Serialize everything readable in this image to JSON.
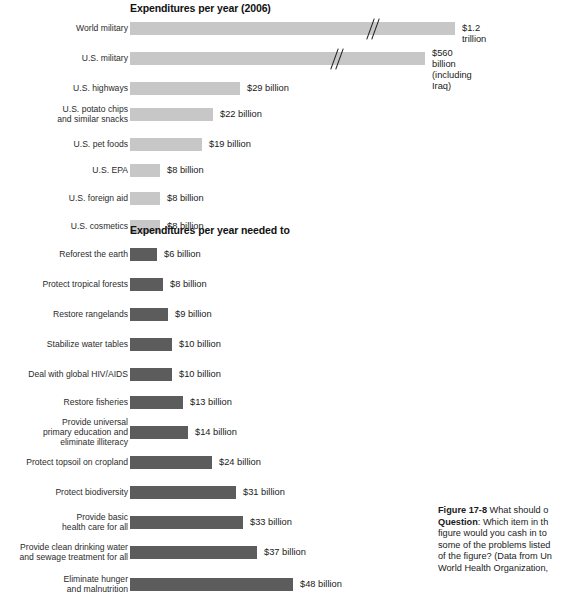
{
  "figure": {
    "number": "Figure 17-8",
    "caption_text": " What should o",
    "question_label": "Question",
    "question_lines": [
      ": Which item in th",
      "figure would you cash in to ",
      "some of the problems listed ",
      "of the figure? (Data from Un",
      "World Health Organization,"
    ]
  },
  "colors": {
    "light_bar": "#c7c7c7",
    "dark_bar": "#5c5c5c",
    "text": "#1a1a1a"
  },
  "chart_data": [
    {
      "type": "bar",
      "orientation": "horizontal",
      "title": "Expenditures per year (2006)",
      "xlabel": "",
      "ylabel": "",
      "bar_color": "#c7c7c7",
      "note": "Top two bars are drawn with axis-break slash marks; their drawn length is truncated relative to value.",
      "categories": [
        "World military",
        "U.S. military",
        "U.S. highways",
        "U.S. potato chips\nand similar snacks",
        "U.S. pet foods",
        "U.S. EPA",
        "U.S. foreign aid",
        "U.S. cosmetics"
      ],
      "values": [
        1200,
        560,
        29,
        22,
        19,
        8,
        8,
        8
      ],
      "value_labels": [
        "$1.2 trillion",
        "$560 billion\n(including Iraq)",
        "$29 billion",
        "$22 billion",
        "$19 billion",
        "$8 billion",
        "$8 billion",
        "$8 billion"
      ],
      "broken_axis": [
        true,
        true,
        false,
        false,
        false,
        false,
        false,
        false
      ]
    },
    {
      "type": "bar",
      "orientation": "horizontal",
      "title": "Expenditures per year needed to",
      "xlabel": "",
      "ylabel": "",
      "bar_color": "#5c5c5c",
      "categories": [
        "Reforest the earth",
        "Protect tropical forests",
        "Restore rangelands",
        "Stabilize water tables",
        "Deal with global HIV/AIDS",
        "Restore fisheries",
        "Provide universal\nprimary education and\neliminate illiteracy",
        "Protect topsoil on cropland",
        "Protect biodiversity",
        "Provide basic\nhealth care for all",
        "Provide clean drinking water\nand sewage treatment for all",
        "Eliminate hunger\nand malnutrition"
      ],
      "values": [
        6,
        8,
        9,
        10,
        10,
        13,
        14,
        24,
        31,
        33,
        37,
        48
      ],
      "value_labels": [
        "$6 billion",
        "$8 billion",
        "$9 billion",
        "$10 billion",
        "$10 billion",
        "$13 billion",
        "$14 billion",
        "$24 billion",
        "$31 billion",
        "$33 billion",
        "$37 billion",
        "$48 billion"
      ],
      "broken_axis": [
        false,
        false,
        false,
        false,
        false,
        false,
        false,
        false,
        false,
        false,
        false,
        false
      ]
    }
  ]
}
